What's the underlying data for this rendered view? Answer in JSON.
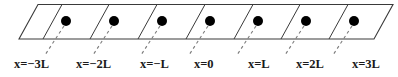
{
  "figure": {
    "type": "lattice-chain-diagram",
    "background_color": "#ffffff",
    "line_color": "#3a3a3a",
    "dot_color": "#000000",
    "label_color": "#1a1a1a"
  },
  "strip": {
    "outline_color": "#3a3a3a",
    "outline_width": 1.1,
    "top_y": 4.5,
    "bottom_y": 39,
    "bottom_left_x": 19,
    "bottom_right_x": 374,
    "skew_dx": 19,
    "cell_count": 8
  },
  "dividers": {
    "count": 7,
    "bottom_x": [
      43,
      90,
      138,
      186,
      234,
      281,
      329
    ],
    "color": "#3a3a3a",
    "width": 1.0
  },
  "sites": {
    "count": 7,
    "radius": 5.0,
    "color": "#000000",
    "cx": [
      66,
      114,
      162,
      210,
      258,
      306,
      354
    ],
    "cy": 21
  },
  "leaders": {
    "color": "#7a7a7a",
    "width": 1.1,
    "dash": "3,3",
    "from": [
      {
        "x": 64,
        "y": 26
      },
      {
        "x": 112,
        "y": 26
      },
      {
        "x": 160,
        "y": 26
      },
      {
        "x": 208,
        "y": 26
      },
      {
        "x": 256,
        "y": 26
      },
      {
        "x": 304,
        "y": 26
      },
      {
        "x": 352,
        "y": 26
      }
    ],
    "to": [
      {
        "x": 45,
        "y": 55
      },
      {
        "x": 93,
        "y": 55
      },
      {
        "x": 141,
        "y": 55
      },
      {
        "x": 189,
        "y": 55
      },
      {
        "x": 237,
        "y": 55
      },
      {
        "x": 285,
        "y": 55
      },
      {
        "x": 333,
        "y": 55
      }
    ]
  },
  "labels": [
    {
      "text": "x=−3L",
      "left": 14,
      "top": 58
    },
    {
      "text": "x=−2L",
      "left": 76,
      "top": 58
    },
    {
      "text": "x=−L",
      "left": 140,
      "top": 58
    },
    {
      "text": "x=0",
      "left": 194,
      "top": 58
    },
    {
      "text": "x=L",
      "left": 248,
      "top": 58
    },
    {
      "text": "x=2L",
      "left": 296,
      "top": 58
    },
    {
      "text": "x=3L",
      "left": 352,
      "top": 58
    }
  ],
  "chart_data": {
    "type": "scatter",
    "title": "",
    "xlabel": "",
    "ylabel": "",
    "categories": [
      "x=-3L",
      "x=-2L",
      "x=-L",
      "x=0",
      "x=L",
      "x=2L",
      "x=3L"
    ],
    "x": [
      -3,
      -2,
      -1,
      0,
      1,
      2,
      3
    ],
    "values": [
      0,
      0,
      0,
      0,
      0,
      0,
      0
    ],
    "unit": "L",
    "grid": false,
    "legend": "none",
    "annotations": [
      "Lattice sites spaced by period L along a one-dimensional chain",
      "Origin site labelled x=0 at the centre of the chain"
    ]
  }
}
